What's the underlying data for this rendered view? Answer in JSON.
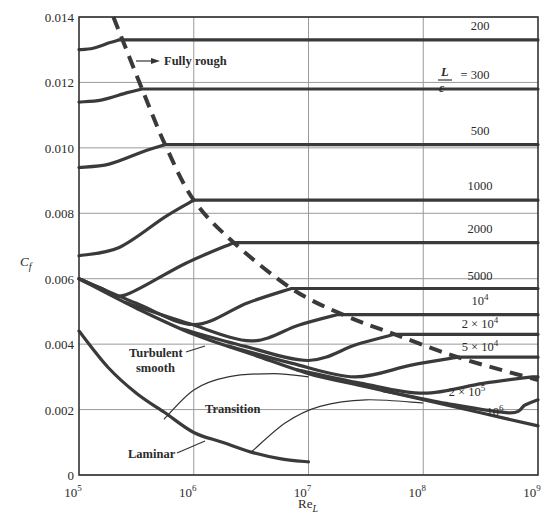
{
  "chart_data": {
    "type": "line",
    "title": "",
    "xlabel": "Re_L",
    "ylabel": "C_f",
    "xscale": "log",
    "xlim": [
      100000,
      1000000000
    ],
    "ylim": [
      0,
      0.014
    ],
    "grid": true,
    "x_ticks": [
      {
        "value": 100000,
        "base": "10",
        "exp": "5"
      },
      {
        "value": 1000000,
        "base": "10",
        "exp": "6"
      },
      {
        "value": 10000000,
        "base": "10",
        "exp": "7"
      },
      {
        "value": 100000000,
        "base": "10",
        "exp": "8"
      },
      {
        "value": 1000000000,
        "base": "10",
        "exp": "9"
      }
    ],
    "y_ticks": [
      "0",
      "0.002",
      "0.004",
      "0.006",
      "0.008",
      "0.010",
      "0.012",
      "0.014"
    ],
    "y_tick_values": [
      0,
      0.002,
      0.004,
      0.006,
      0.008,
      0.01,
      0.012,
      0.014
    ],
    "series": [
      {
        "name": "L/ε = 200",
        "label": "200",
        "fully_rough_cf": 0.0133,
        "start_cf": 0.013,
        "transition_log_re": 5.35
      },
      {
        "name": "L/ε = 300",
        "label": "= 300",
        "fully_rough_cf": 0.0118,
        "start_cf": 0.0114,
        "transition_log_re": 5.55
      },
      {
        "name": "L/ε = 500",
        "label": "500",
        "fully_rough_cf": 0.0101,
        "start_cf": 0.0094,
        "transition_log_re": 5.75
      },
      {
        "name": "L/ε = 1000",
        "label": "1000",
        "fully_rough_cf": 0.0084,
        "start_cf": 0.0067,
        "transition_log_re": 6.0
      },
      {
        "name": "L/ε = 2000",
        "label": "2000",
        "fully_rough_cf": 0.0071,
        "dip_cf": 0.0055,
        "dip_log_re": 5.4,
        "transition_log_re": 6.35
      },
      {
        "name": "L/ε = 5000",
        "label": "5000",
        "fully_rough_cf": 0.0057,
        "dip_cf": 0.0046,
        "dip_log_re": 6.0,
        "transition_log_re": 6.85
      },
      {
        "name": "L/ε = 10^4",
        "label": "10",
        "label_exp": "4",
        "fully_rough_cf": 0.0049,
        "dip_cf": 0.0041,
        "dip_log_re": 6.5,
        "transition_log_re": 7.25
      },
      {
        "name": "L/ε = 2×10^4",
        "label": "2 × 10",
        "label_exp": "4",
        "fully_rough_cf": 0.0043,
        "dip_cf": 0.0035,
        "dip_log_re": 7.0,
        "transition_log_re": 7.75
      },
      {
        "name": "L/ε = 5×10^4",
        "label": "5 × 10",
        "label_exp": "4",
        "fully_rough_cf": 0.0036,
        "dip_cf": 0.003,
        "dip_log_re": 7.4,
        "transition_log_re": 8.3
      },
      {
        "name": "L/ε = 2×10^5",
        "label": "2 × 10",
        "label_exp": "5",
        "fully_rough_cf": 0.003,
        "dip_cf": 0.0025,
        "dip_log_re": 8.0,
        "transition_log_re": 8.95
      },
      {
        "name": "L/ε = 10^6",
        "label": "10",
        "label_exp": "6",
        "fully_rough_cf": 0.0023,
        "dip_cf": 0.0019,
        "dip_log_re": 8.75,
        "transition_log_re": 9.0
      },
      {
        "name": "Turbulent smooth",
        "points": [
          [
            5.0,
            0.006
          ],
          [
            5.5,
            0.0051
          ],
          [
            6.0,
            0.0043
          ],
          [
            6.5,
            0.0037
          ],
          [
            7.0,
            0.0031
          ],
          [
            7.5,
            0.0027
          ],
          [
            8.0,
            0.0023
          ],
          [
            8.5,
            0.0019
          ],
          [
            9.0,
            0.0015
          ]
        ]
      },
      {
        "name": "Laminar",
        "points": [
          [
            5.0,
            0.0044
          ],
          [
            5.25,
            0.0033
          ],
          [
            5.5,
            0.0025
          ],
          [
            5.75,
            0.0019
          ],
          [
            6.0,
            0.0013
          ],
          [
            6.25,
            0.001
          ],
          [
            6.5,
            0.0007
          ],
          [
            6.75,
            0.0005
          ],
          [
            7.0,
            0.0004
          ]
        ]
      },
      {
        "name": "Transition (Re_t = 5×10^5)",
        "points": [
          [
            5.74,
            0.0017
          ],
          [
            6.0,
            0.0026
          ],
          [
            6.3,
            0.003
          ],
          [
            6.7,
            0.0031
          ],
          [
            7.0,
            0.003
          ]
        ]
      },
      {
        "name": "Transition (Re_t = 3×10^6)",
        "points": [
          [
            6.5,
            0.0007
          ],
          [
            6.8,
            0.0016
          ],
          [
            7.1,
            0.0021
          ],
          [
            7.5,
            0.0023
          ],
          [
            8.0,
            0.0022
          ]
        ]
      },
      {
        "name": "Fully rough boundary",
        "style": "dashed",
        "points": [
          [
            5.3,
            0.014
          ],
          [
            5.55,
            0.0118
          ],
          [
            5.75,
            0.0101
          ],
          [
            6.0,
            0.0084
          ],
          [
            6.35,
            0.0071
          ],
          [
            6.85,
            0.0057
          ],
          [
            7.3,
            0.0049
          ],
          [
            7.75,
            0.0043
          ],
          [
            8.3,
            0.0036
          ],
          [
            9.0,
            0.0029
          ]
        ]
      }
    ],
    "annotations": {
      "fully_rough": "Fully rough",
      "turbulent_line1": "Turbulent",
      "turbulent_line2": "smooth",
      "transition": "Transition",
      "laminar": "Laminar",
      "ratio_numerator": "L",
      "ratio_denominator": "ε"
    }
  }
}
